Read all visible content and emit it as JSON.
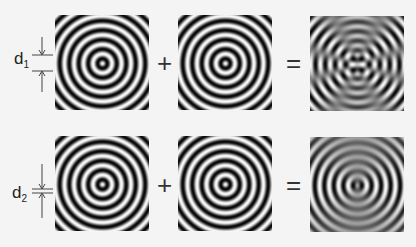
{
  "rows": [
    {
      "label": "d",
      "subscript": "1",
      "operators": {
        "plus": "+",
        "equals": "="
      },
      "result_pattern": "interference-wide-separation"
    },
    {
      "label": "d",
      "subscript": "2",
      "operators": {
        "plus": "+",
        "equals": "="
      },
      "result_pattern": "interference-narrow-separation"
    }
  ],
  "colors": {
    "background": "#f4f4f4",
    "ring_dark": "#1a1a1a",
    "ring_light": "#e8e8e8",
    "marker": "#444444"
  }
}
